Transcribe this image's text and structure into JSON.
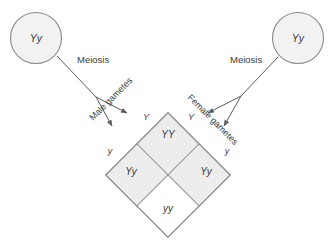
{
  "diagram": {
    "background_color": "#ffffff",
    "shaded_cell_color": "#ededed",
    "open_cell_color": "#ffffff",
    "outline_color": "#8f8f8f",
    "text_color": "#3a3a3a"
  },
  "parents": [
    {
      "id": "male-parent",
      "genotype": "Yy",
      "side": "left"
    },
    {
      "id": "female-parent",
      "genotype": "Yy",
      "side": "right"
    }
  ],
  "processes": [
    {
      "id": "meiosis-left",
      "label": "Meiosis"
    },
    {
      "id": "meiosis-right",
      "label": "Meiosis"
    }
  ],
  "gamete_axes": [
    {
      "id": "male-gametes",
      "label": "Male gametes",
      "alleles": [
        "Y",
        "y"
      ]
    },
    {
      "id": "female-gametes",
      "label": "Female gametes",
      "alleles": [
        "Y",
        "y"
      ]
    }
  ],
  "punnett_square": {
    "cells": [
      {
        "position": "top",
        "genotype": "YY",
        "shaded": true
      },
      {
        "position": "left",
        "genotype": "Yy",
        "shaded": true
      },
      {
        "position": "right",
        "genotype": "Yy",
        "shaded": true
      },
      {
        "position": "bottom",
        "genotype": "yy",
        "shaded": false
      }
    ]
  }
}
